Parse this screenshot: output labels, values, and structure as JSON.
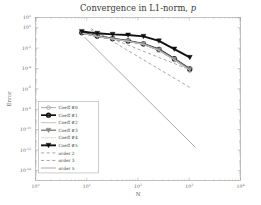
{
  "figure": {
    "title_main": "Convergence in L1-norm, ",
    "title_italic": "p",
    "xlabel": "N",
    "ylabel": "Error"
  },
  "axes": {
    "x_ticks": [
      "0",
      "1",
      "2",
      "3",
      "4"
    ],
    "x_tick_base": "10",
    "y_ticks": [
      "1",
      "0",
      "-2",
      "-4",
      "-6",
      "-8",
      "-10",
      "-12",
      "-14"
    ],
    "y_tick_base": "10"
  },
  "legend": {
    "items": [
      {
        "label": "Coeff #0",
        "marker": "circle",
        "style": "solid",
        "color": "#9b9b9b",
        "width": 0.8
      },
      {
        "label": "Coeff #1",
        "marker": "circle",
        "style": "solid",
        "color": "#111111",
        "width": 1.7
      },
      {
        "label": "Coeff #2",
        "marker": "none",
        "style": "solid",
        "color": "#c2c2c2",
        "width": 1.0
      },
      {
        "label": "Coeff #3",
        "marker": "triangle",
        "style": "solid",
        "color": "#8a8a8a",
        "width": 1.5
      },
      {
        "label": "Coeff #4",
        "marker": "none",
        "style": "solid",
        "color": "#d2d2d2",
        "width": 0.8
      },
      {
        "label": "Coeff #5",
        "marker": "triangle",
        "style": "solid",
        "color": "#111111",
        "width": 1.9
      },
      {
        "label": "order 2",
        "marker": "none",
        "style": "dashed",
        "color": "#6e6e6e",
        "width": 0.6
      },
      {
        "label": "order 3",
        "marker": "none",
        "style": "dashed",
        "color": "#6e6e6e",
        "width": 0.6
      },
      {
        "label": "order 5",
        "marker": "none",
        "style": "solid",
        "color": "#6e6e6e",
        "width": 0.6
      }
    ]
  },
  "chart_data": {
    "type": "line",
    "title": "Convergence in L1-norm, p",
    "xlabel": "N",
    "ylabel": "Error",
    "xscale": "log",
    "yscale": "log",
    "xlim": [
      1,
      10000
    ],
    "ylim": [
      1e-15,
      10
    ],
    "grid": false,
    "legend_position": "lower-left",
    "x": [
      8,
      16,
      32,
      64,
      128,
      256,
      512,
      1024
    ],
    "series": [
      {
        "name": "Coeff #0",
        "values": [
          0.28,
          0.13,
          0.075,
          0.045,
          0.022,
          0.0055,
          0.00065,
          6e-05
        ],
        "color": "#9b9b9b",
        "marker": "circle",
        "style": "solid"
      },
      {
        "name": "Coeff #1",
        "values": [
          0.33,
          0.15,
          0.085,
          0.05,
          0.026,
          0.0075,
          0.0009,
          9e-05
        ],
        "color": "#111111",
        "marker": "circle",
        "style": "solid"
      },
      {
        "name": "Coeff #2",
        "values": [
          0.3,
          0.14,
          0.078,
          0.047,
          0.024,
          0.0062,
          0.00072,
          7e-05
        ],
        "color": "#c2c2c2",
        "marker": "none",
        "style": "solid"
      },
      {
        "name": "Coeff #3",
        "values": [
          0.31,
          0.145,
          0.08,
          0.048,
          0.025,
          0.0068,
          0.0008,
          8e-05
        ],
        "color": "#8a8a8a",
        "marker": "triangle",
        "style": "solid"
      },
      {
        "name": "Coeff #4",
        "values": [
          0.29,
          0.135,
          0.077,
          0.046,
          0.023,
          0.006,
          0.0007,
          6.5e-05
        ],
        "color": "#d2d2d2",
        "marker": "none",
        "style": "solid"
      },
      {
        "name": "Coeff #5",
        "values": [
          0.42,
          0.28,
          0.22,
          0.19,
          0.14,
          0.05,
          0.008,
          0.0012
        ],
        "color": "#111111",
        "marker": "triangle",
        "style": "solid"
      }
    ],
    "reference_lines": [
      {
        "name": "order 2",
        "order": 2,
        "style": "dashed"
      },
      {
        "name": "order 3",
        "order": 3,
        "style": "dashed"
      },
      {
        "name": "order 5",
        "order": 5,
        "style": "solid"
      }
    ]
  }
}
